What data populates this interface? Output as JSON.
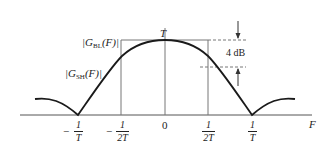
{
  "diagram": {
    "peak_label": "T",
    "gbl_label": {
      "prefix": "|G",
      "sub": "BL",
      "suffix": "(F)|"
    },
    "gsh_label": {
      "prefix": "|G",
      "sub": "SH",
      "suffix": "(F)|"
    },
    "db_label": "4 dB",
    "axis_label": "F",
    "ticks": [
      {
        "sign": "−",
        "num": "1",
        "den": "T"
      },
      {
        "sign": "−",
        "num": "1",
        "den": "2T"
      },
      {
        "plain": "0"
      },
      {
        "sign": "",
        "num": "1",
        "den": "2T"
      },
      {
        "sign": "",
        "num": "1",
        "den": "T"
      }
    ],
    "colors": {
      "curve": "#1a1a1a",
      "lines": "#666666",
      "text": "#222222"
    }
  }
}
